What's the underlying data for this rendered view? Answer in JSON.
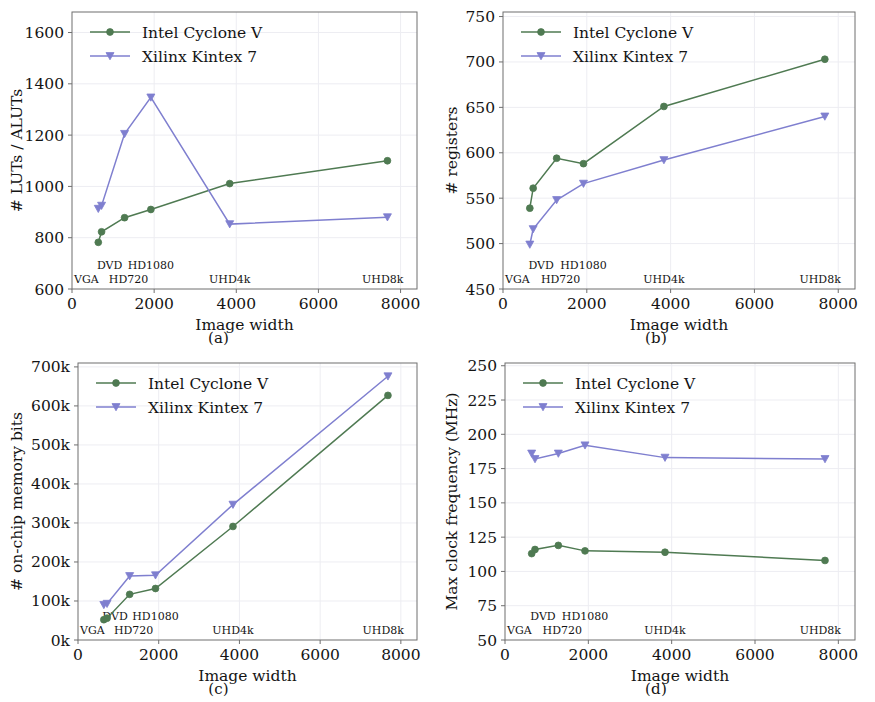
{
  "colors": {
    "intel": "#4f7a52",
    "xilinx": "#7f7fcf",
    "frame": "#6f6f6f",
    "grid": "#ededf2",
    "text": "#141414",
    "background": "#ffffff"
  },
  "legend": {
    "intel_label": "Intel Cyclone V",
    "xilinx_label": "Xilinx Kintex 7"
  },
  "resolution_labels": {
    "vga": "VGA",
    "dvd": "DVD",
    "hd720": "HD720",
    "hd1080": "HD1080",
    "uhd4k": "UHD4k",
    "uhd8k": "UHD8k"
  },
  "captions": {
    "a": "(a)",
    "b": "(b)",
    "c": "(c)",
    "d": "(d)"
  },
  "chart_data": [
    {
      "id": "a",
      "type": "line",
      "title": "",
      "xlabel": "Image width",
      "ylabel": "# LUTs / ALUTs",
      "xlim": [
        0,
        8400
      ],
      "ylim": [
        600,
        1680
      ],
      "xticks": [
        0,
        2000,
        4000,
        6000,
        8000
      ],
      "xticklabels": [
        "0",
        "2000",
        "4000",
        "6000",
        "8000"
      ],
      "yticks": [
        600,
        800,
        1000,
        1200,
        1400,
        1600
      ],
      "yticklabels": [
        "600",
        "800",
        "1000",
        "1200",
        "1400",
        "1600"
      ],
      "grid": true,
      "legend_position": "top-left",
      "x": [
        640,
        720,
        1280,
        1920,
        3840,
        7680
      ],
      "annotations": [
        "VGA",
        "DVD",
        "HD720",
        "HD1080",
        "UHD4k",
        "UHD8k"
      ],
      "series": [
        {
          "name": "Intel Cyclone V",
          "values": [
            782,
            823,
            878,
            910,
            1011,
            1100
          ]
        },
        {
          "name": "Xilinx Kintex 7",
          "values": [
            913,
            925,
            1205,
            1347,
            853,
            880
          ]
        }
      ]
    },
    {
      "id": "b",
      "type": "line",
      "title": "",
      "xlabel": "Image width",
      "ylabel": "# registers",
      "xlim": [
        0,
        8400
      ],
      "ylim": [
        450,
        755
      ],
      "xticks": [
        0,
        2000,
        4000,
        6000,
        8000
      ],
      "xticklabels": [
        "0",
        "2000",
        "4000",
        "6000",
        "8000"
      ],
      "yticks": [
        450,
        500,
        550,
        600,
        650,
        700,
        750
      ],
      "yticklabels": [
        "450",
        "500",
        "550",
        "600",
        "650",
        "700",
        "750"
      ],
      "grid": true,
      "legend_position": "top-left",
      "x": [
        640,
        720,
        1280,
        1920,
        3840,
        7680
      ],
      "annotations": [
        "VGA",
        "DVD",
        "HD720",
        "HD1080",
        "UHD4k",
        "UHD8k"
      ],
      "series": [
        {
          "name": "Intel Cyclone V",
          "values": [
            539,
            561,
            594,
            588,
            651,
            703
          ]
        },
        {
          "name": "Xilinx Kintex 7",
          "values": [
            499,
            516,
            548,
            566,
            592,
            640
          ]
        }
      ]
    },
    {
      "id": "c",
      "type": "line",
      "title": "",
      "xlabel": "Image width",
      "ylabel": "# on-chip memory bits",
      "xlim": [
        0,
        8400
      ],
      "ylim": [
        0,
        710000
      ],
      "xticks": [
        0,
        2000,
        4000,
        6000,
        8000
      ],
      "xticklabels": [
        "0",
        "2000",
        "4000",
        "6000",
        "8000"
      ],
      "yticks": [
        0,
        100000,
        200000,
        300000,
        400000,
        500000,
        600000,
        700000
      ],
      "yticklabels": [
        "0k",
        "100k",
        "200k",
        "300k",
        "400k",
        "500k",
        "600k",
        "700k"
      ],
      "grid": true,
      "legend_position": "top-left",
      "x": [
        640,
        720,
        1280,
        1920,
        3840,
        7680
      ],
      "annotations": [
        "VGA",
        "DVD",
        "HD720",
        "HD1080",
        "UHD4k",
        "UHD8k"
      ],
      "series": [
        {
          "name": "Intel Cyclone V",
          "values": [
            52000,
            56000,
            117000,
            132000,
            291000,
            627000
          ]
        },
        {
          "name": "Xilinx Kintex 7",
          "values": [
            90000,
            93000,
            164000,
            166000,
            347000,
            676000
          ]
        }
      ]
    },
    {
      "id": "d",
      "type": "line",
      "title": "",
      "xlabel": "Image width",
      "ylabel": "Max clock frequency (MHz)",
      "xlim": [
        0,
        8400
      ],
      "ylim": [
        50,
        252
      ],
      "xticks": [
        0,
        2000,
        4000,
        6000,
        8000
      ],
      "xticklabels": [
        "0",
        "2000",
        "4000",
        "6000",
        "8000"
      ],
      "yticks": [
        50,
        75,
        100,
        125,
        150,
        175,
        200,
        225,
        250
      ],
      "yticklabels": [
        "50",
        "75",
        "100",
        "125",
        "150",
        "175",
        "200",
        "225",
        "250"
      ],
      "grid": true,
      "legend_position": "top-left",
      "x": [
        640,
        720,
        1280,
        1920,
        3840,
        7680
      ],
      "annotations": [
        "VGA",
        "DVD",
        "HD720",
        "HD1080",
        "UHD4k",
        "UHD8k"
      ],
      "series": [
        {
          "name": "Intel Cyclone V",
          "values": [
            113,
            116,
            119,
            115,
            114,
            108
          ]
        },
        {
          "name": "Xilinx Kintex 7",
          "values": [
            186,
            182,
            186,
            192,
            183,
            182
          ]
        }
      ]
    }
  ]
}
